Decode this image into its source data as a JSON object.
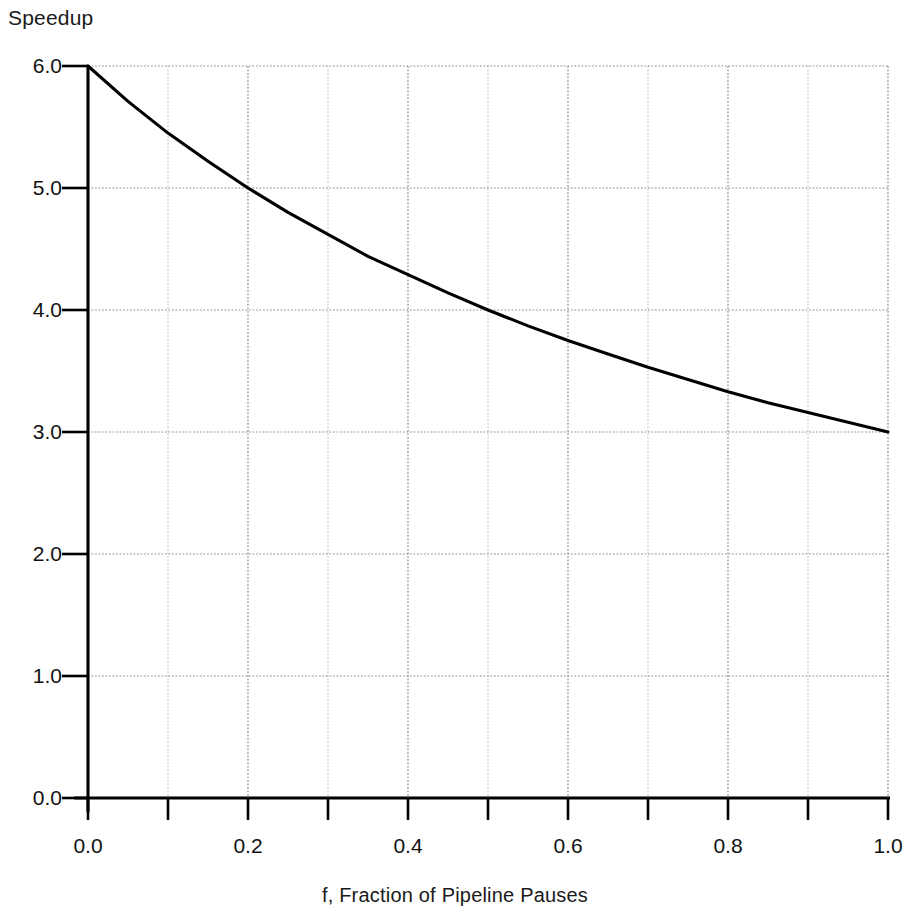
{
  "chart_data": {
    "type": "line",
    "title": "",
    "ylabel": "Speedup",
    "xlabel": "f, Fraction of Pipeline Pauses",
    "xlim": [
      0.0,
      1.0
    ],
    "ylim": [
      0.0,
      6.0
    ],
    "grid": true,
    "legend": "none",
    "x_tick_labels": [
      "0.0",
      "0.2",
      "0.4",
      "0.6",
      "0.8",
      "1.0"
    ],
    "x_tick_values": [
      0.0,
      0.2,
      0.4,
      0.6,
      0.8,
      1.0
    ],
    "x_minor_ticks": [
      0.1,
      0.3,
      0.5,
      0.7,
      0.9
    ],
    "y_tick_labels": [
      "0.0",
      "1.0",
      "2.0",
      "3.0",
      "4.0",
      "5.0",
      "6.0"
    ],
    "y_tick_values": [
      0.0,
      1.0,
      2.0,
      3.0,
      4.0,
      5.0,
      6.0
    ],
    "series": [
      {
        "name": "Speedup = 6 / (1 + f)",
        "x": [
          0.0,
          0.05,
          0.1,
          0.15,
          0.2,
          0.25,
          0.3,
          0.35,
          0.4,
          0.45,
          0.5,
          0.55,
          0.6,
          0.65,
          0.7,
          0.75,
          0.8,
          0.85,
          0.9,
          0.95,
          1.0
        ],
        "values": [
          6.0,
          5.71,
          5.45,
          5.22,
          5.0,
          4.8,
          4.62,
          4.44,
          4.29,
          4.14,
          4.0,
          3.87,
          3.75,
          3.64,
          3.53,
          3.43,
          3.33,
          3.24,
          3.16,
          3.08,
          3.0
        ]
      }
    ],
    "colors": {
      "curve": "#000000",
      "axis": "#000000",
      "grid_minor": "#b9b9b9",
      "grid_major": "#8d8d8d",
      "background": "#ffffff"
    }
  }
}
